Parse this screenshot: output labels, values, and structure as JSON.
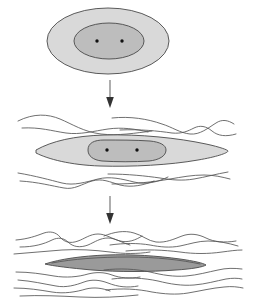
{
  "figure": {
    "background_color": "#ffffff",
    "width": 257,
    "height": 302,
    "colors": {
      "outer_fill": "#d9d9d9",
      "inner_fill": "#bdbdbd",
      "core_fill": "#9a9a9a",
      "outline": "#4a4a4a",
      "flow_line": "#555555",
      "dot": "#111111",
      "arrow": "#555555"
    }
  },
  "stages": [
    {
      "id": "stage-1",
      "label": "Stage 1 — undeformed ellipse",
      "outer_shape": "ellipse",
      "outer_center": [
        108,
        41
      ],
      "outer_radii": [
        61,
        33
      ],
      "inner_shape": "ellipse",
      "inner_center": [
        109,
        41
      ],
      "inner_radii": [
        35,
        18
      ],
      "dots": [
        [
          97,
          41
        ],
        [
          122,
          41
        ]
      ],
      "dot_radius": 1.7,
      "flow_lines_above": 0,
      "flow_lines_below": 0,
      "aspect_ratio": "1.8 : 1"
    },
    {
      "id": "stage-2",
      "label": "Stage 2 — moderately flattened lens",
      "outer_shape": "lens",
      "outer_center": [
        128,
        150
      ],
      "outer_radii": [
        107,
        19
      ],
      "inner_shape": "rounded-lens",
      "inner_center": [
        122,
        150
      ],
      "inner_radii": [
        44,
        12
      ],
      "dots": [
        [
          107,
          150
        ],
        [
          137,
          150
        ]
      ],
      "dot_radius": 1.7,
      "flow_lines_above": 4,
      "flow_lines_below": 4,
      "aspect_ratio": "5.6 : 1"
    },
    {
      "id": "stage-3",
      "label": "Stage 3 — extremely attenuated sliver",
      "outer_shape": "sliver",
      "outer_center": [
        126,
        262
      ],
      "outer_radii": [
        81,
        7
      ],
      "inner_shape": "none",
      "dots": [],
      "dot_radius": 0,
      "flow_lines_above": 6,
      "flow_lines_below": 7,
      "aspect_ratio": "23 : 1"
    }
  ],
  "arrows": [
    {
      "id": "arrow-1",
      "label": "progression arrow one",
      "x": 110,
      "y_start": 80,
      "y_end": 108,
      "direction": "down"
    },
    {
      "id": "arrow-2",
      "label": "progression arrow two",
      "x": 110,
      "y_start": 196,
      "y_end": 224,
      "direction": "down"
    }
  ]
}
